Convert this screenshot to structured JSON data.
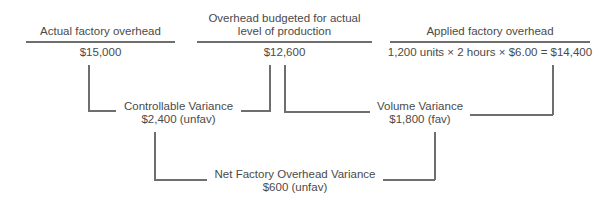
{
  "columns": [
    {
      "header": "Actual factory overhead",
      "value": "$15,000"
    },
    {
      "header_line1": "Overhead budgeted for actual",
      "header_line2": "level of production",
      "value": "$12,600"
    },
    {
      "header": "Applied factory overhead",
      "value": "1,200 units × 2 hours × $6.00 = $14,400"
    }
  ],
  "variances": {
    "controllable": {
      "label": "Controllable Variance",
      "value": "$2,400 (unfav)"
    },
    "volume": {
      "label": "Volume Variance",
      "value": "$1,800 (fav)"
    },
    "net": {
      "label": "Net Factory Overhead Variance",
      "value": "$600 (unfav)"
    }
  },
  "colors": {
    "line": "#6e6e6e",
    "text": "#4a4a4a"
  }
}
